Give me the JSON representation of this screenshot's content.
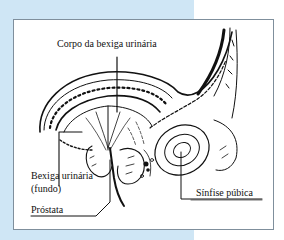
{
  "figure": {
    "labels": {
      "body": "Corpo da bexiga urinária",
      "fundus_line1": "Bexiga urinária",
      "fundus_line2": "(fundo)",
      "prostate": "Próstata",
      "symphysis": "Sínfise púbica"
    },
    "colors": {
      "backdrop": "#cfe6f5",
      "frame_border": "#7f8f9c",
      "ink": "#111111"
    }
  }
}
